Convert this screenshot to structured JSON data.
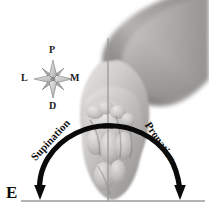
{
  "figure": {
    "panel_letter": "E",
    "background_color": "#ffffff"
  },
  "compass": {
    "name": "anatomical-orientation-compass",
    "north_label": "P",
    "west_label": "L",
    "east_label": "M",
    "south_label": "D",
    "star_fill": "#cfcfcf",
    "star_stroke": "#6f6f6f"
  },
  "motion_arcs": {
    "left": {
      "label": "Supination",
      "color": "#0a0a0a",
      "direction": "counterclockwise-down-left"
    },
    "right": {
      "label": "Pronation",
      "color": "#0a0a0a",
      "direction": "clockwise-down-right"
    }
  },
  "axis": {
    "vertical_line_color": "#9a9a9a",
    "baseline_color": "#9a9a9a"
  },
  "anatomy": {
    "subject": "forearm-and-hand-photograph",
    "skin_light": "#f2f0ef",
    "skin_mid": "#b7b5b3",
    "skin_dark": "#7d7b79"
  }
}
